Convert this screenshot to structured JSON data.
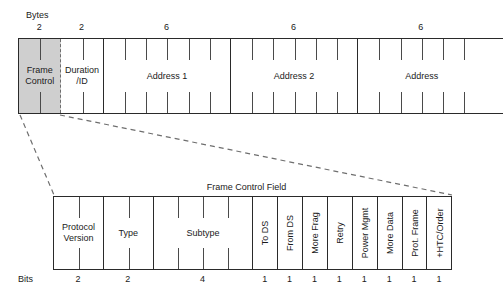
{
  "diagram": {
    "title_bottom": "Frame Control Field",
    "top_axis_label": "Bytes",
    "bottom_axis_label": "Bits"
  },
  "mac_header": {
    "fields": [
      {
        "name": "Frame\nControl",
        "bytes": "2",
        "shaded": true
      },
      {
        "name": "Duration\n/ID",
        "bytes": "2",
        "shaded": false
      },
      {
        "name": "Address 1",
        "bytes": "6",
        "shaded": false
      },
      {
        "name": "Address 2",
        "bytes": "6",
        "shaded": false
      },
      {
        "name": "Address",
        "bytes": "6",
        "shaded": false
      }
    ]
  },
  "frame_control": {
    "fields": [
      {
        "name": "Protocol\nVersion",
        "bits": "2",
        "orientation": "horizontal"
      },
      {
        "name": "Type",
        "bits": "2",
        "orientation": "horizontal"
      },
      {
        "name": "Subtype",
        "bits": "4",
        "orientation": "horizontal"
      },
      {
        "name": "To DS",
        "bits": "1",
        "orientation": "vertical"
      },
      {
        "name": "From DS",
        "bits": "1",
        "orientation": "vertical"
      },
      {
        "name": "More Frag",
        "bits": "1",
        "orientation": "vertical"
      },
      {
        "name": "Retry",
        "bits": "1",
        "orientation": "vertical"
      },
      {
        "name": "Power Mgmt",
        "bits": "1",
        "orientation": "vertical"
      },
      {
        "name": "More Data",
        "bits": "1",
        "orientation": "vertical"
      },
      {
        "name": "Prot. Frame",
        "bits": "1",
        "orientation": "vertical"
      },
      {
        "name": "+HTC/Order",
        "bits": "1",
        "orientation": "vertical"
      }
    ]
  },
  "colors": {
    "stroke": "#2a2a2a",
    "shade": "#cfcfcf",
    "dashed": "#6e6e6e",
    "text": "#1a1a1a"
  }
}
